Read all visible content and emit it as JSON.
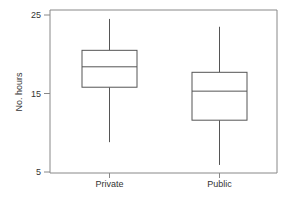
{
  "chart_data": {
    "type": "box",
    "title": "",
    "xlabel": "",
    "ylabel": "No. hours",
    "ylim": [
      5,
      25
    ],
    "yticks": [
      5,
      15,
      25
    ],
    "categories": [
      "Private",
      "Public"
    ],
    "series": [
      {
        "name": "Private",
        "whisker_low": 8.8,
        "q1": 15.8,
        "median": 18.4,
        "q3": 20.5,
        "whisker_high": 24.5
      },
      {
        "name": "Public",
        "whisker_low": 5.9,
        "q1": 11.6,
        "median": 15.3,
        "q3": 17.7,
        "whisker_high": 23.5
      }
    ],
    "grid": false,
    "legend": "none"
  },
  "colors": {
    "line": "#555555",
    "frame": "#888888",
    "text": "#333333"
  }
}
